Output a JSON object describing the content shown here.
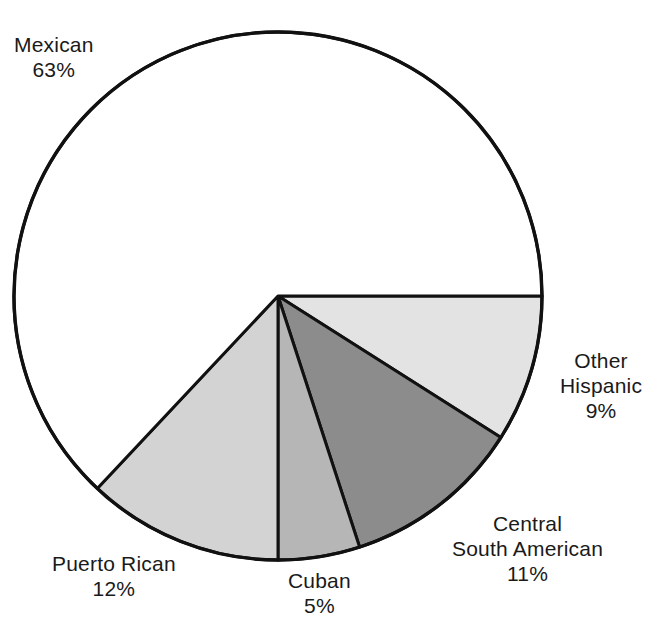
{
  "chart_data": {
    "type": "pie",
    "title": "",
    "subtitle": "",
    "xlabel": "",
    "ylabel": "",
    "legend_position": "none",
    "grid": false,
    "units": "percent",
    "total": 100,
    "start_angle_deg": 0,
    "direction": "clockwise",
    "categories": [
      "Other Hispanic",
      "Central South American",
      "Cuban",
      "Puerto Rican",
      "Mexican"
    ],
    "values": [
      9,
      11,
      5,
      12,
      63
    ],
    "slices": [
      {
        "name": "other-hispanic",
        "label_lines": [
          "Other",
          "Hispanic",
          "9%"
        ],
        "value": 9,
        "value_text": "9%",
        "color": "#e3e3e3",
        "start_deg": 0,
        "end_deg": 32.4
      },
      {
        "name": "central-south-american",
        "label_lines": [
          "Central",
          "South American",
          "11%"
        ],
        "value": 11,
        "value_text": "11%",
        "color": "#8c8c8c",
        "start_deg": 32.4,
        "end_deg": 72.0
      },
      {
        "name": "cuban",
        "label_lines": [
          "Cuban",
          "5%"
        ],
        "value": 5,
        "value_text": "5%",
        "color": "#b6b6b6",
        "start_deg": 72.0,
        "end_deg": 90.0
      },
      {
        "name": "puerto-rican",
        "label_lines": [
          "Puerto Rican",
          "12%"
        ],
        "value": 12,
        "value_text": "12%",
        "color": "#d3d3d3",
        "start_deg": 90.0,
        "end_deg": 133.2
      },
      {
        "name": "mexican",
        "label_lines": [
          "Mexican",
          "63%"
        ],
        "value": 63,
        "value_text": "63%",
        "color": "#ffffff",
        "start_deg": 133.2,
        "end_deg": 360.0
      }
    ]
  },
  "labels": {
    "mexican": {
      "line1": "Mexican",
      "line2": "63%"
    },
    "other_hispanic": {
      "line1": "Other",
      "line2": "Hispanic",
      "line3": "9%"
    },
    "central_south_american": {
      "line1": "Central",
      "line2": "South American",
      "line3": "11%"
    },
    "cuban": {
      "line1": "Cuban",
      "line2": "5%"
    },
    "puerto_rican": {
      "line1": "Puerto Rican",
      "line2": "12%"
    }
  },
  "style": {
    "stroke_color": "#111111",
    "background": "#ffffff",
    "text_color": "#1a1a1a"
  }
}
